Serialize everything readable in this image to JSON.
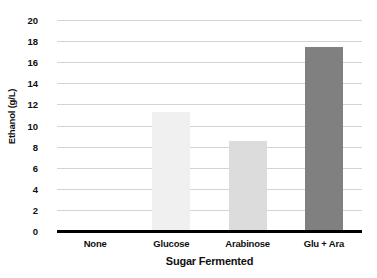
{
  "chart_data": {
    "type": "bar",
    "title": "",
    "xlabel": "Sugar Fermented",
    "ylabel": "Ethanol (g/L)",
    "categories": [
      "None",
      "Glucose",
      "Arabinose",
      "Glu + Ara"
    ],
    "values": [
      0,
      11.3,
      8.5,
      17.4
    ],
    "series": [
      {
        "name": "Ethanol",
        "values": [
          0,
          11.3,
          8.5,
          17.4
        ]
      }
    ],
    "ylim": [
      0,
      20
    ],
    "yticks": [
      0,
      2,
      4,
      6,
      8,
      10,
      12,
      14,
      16,
      18,
      20
    ],
    "ytick_labels": [
      "0",
      "2",
      "4",
      "6",
      "8",
      "10",
      "12",
      "14",
      "16",
      "18",
      "20"
    ],
    "grid": true,
    "grid_axis": "y",
    "legend": false,
    "legend_position": "none",
    "bar_colors": [
      "#ffffff",
      "#f0f0f0",
      "#dcdcdc",
      "#808080"
    ],
    "background_color": "#ffffff",
    "grid_color": "#d3d3d3",
    "axis_color": "#000000",
    "text_color": "#101010"
  }
}
